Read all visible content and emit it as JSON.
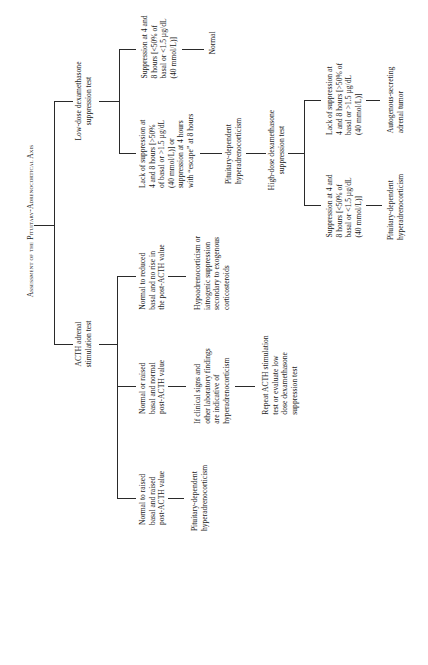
{
  "title": "Assessment of the Pituitary-Adrenocortical Axis",
  "nodes": {
    "low_dose_test": "Low-dose dexamethasone\nsuppression test",
    "low_dose_suppression": "Suppression at 4 and\n8 hours [<50% of\nbasal or <1.5 µg/dL\n(40 mmol/L)]",
    "normal": "Normal",
    "low_dose_lack_of_suppression": "Lack of suppression at\n4 and 8 hours [>50%\nof basal or >1.5 µg/dL\n(40 mmol/L)] or\nsuppression at 4 hours\nwith “escape” at 8 hours",
    "pdh_1": "Pituitary-dependent\nhyperadrenocorticism",
    "high_dose_test": "High-dose dexamethasone\nsuppression test",
    "high_dose_lack_of_suppression": "Lack of suppression at\n4 and 8 hours [>50% of\nbasal or >1.5 µg/dL\n(40 mmol/L)]",
    "adrenal_tumor": "Autogenous-secreting\nadrenal tumor",
    "high_dose_suppression": "Suppression at 4 and\n8 hours [<50% of\nbasal or <1.5 µg/dL\n(40 mmol/L)]",
    "pdh_2": "Pituitary-dependent\nhyperadrenocorticism",
    "acth_test": "ACTH adrenal\nstimulation test",
    "acth_reduced": "Normal to reduced\nbasal and no rise in\nthe post-ACTH value",
    "hypoadrenocorticism": "Hypoadrenocorticism or\niatrogenic suppression\nsecondary to exogenous\ncorticosteroids",
    "acth_normal": "Normal or raised\nbasal and normal\npost-ACTH value",
    "clinical_signs": "If clinical signs and\nother laboratory findings\nare indicative of\nhyperadrenocorticism",
    "repeat_test": "Repeat ACTH stimulation\ntest or evaluate low\ndose dexamethasone\nsuppression test",
    "acth_raised": "Normal to raised\nbasal and raised\npost-ACTH value",
    "pdh_3": "Pituitary-dependent\nhyperadrenocorticism"
  }
}
